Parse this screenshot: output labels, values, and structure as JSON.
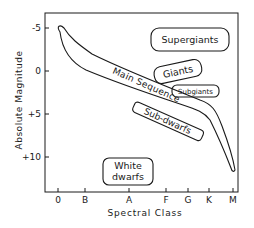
{
  "diagram": {
    "type": "Hertzsprung-Russell diagram",
    "y_axis": {
      "label": "Absolute Magnitude",
      "ticks": [
        "-5",
        "0",
        "+5",
        "+10"
      ]
    },
    "x_axis": {
      "label": "Spectral Class",
      "ticks": [
        "0",
        "B",
        "A",
        "F",
        "G",
        "K",
        "M"
      ]
    },
    "regions": {
      "supergiants": "Supergiants",
      "giants": "Giants",
      "subgiants": "Subgiants",
      "main_sequence": "Main Sequence",
      "sub_dwarfs": "Sub-dwarfs",
      "white_dwarfs_line1": "White",
      "white_dwarfs_line2": "dwarfs"
    },
    "colors": {
      "ink": "#1a1a1a",
      "background": "#ffffff"
    }
  }
}
